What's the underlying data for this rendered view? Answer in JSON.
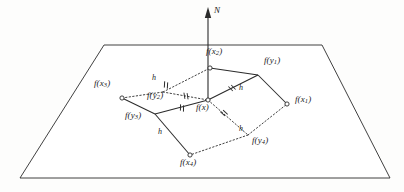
{
  "figure": {
    "type": "geometric-diagram",
    "background_color": "#fdfdfc",
    "line_color": "#2b2b2b",
    "axis": {
      "label": "N",
      "name": "normal-vector"
    },
    "plane": {
      "name": "tangent-plane",
      "shape": "trapezoid",
      "points": "104,45 322,45 390,178 20,178"
    },
    "center": {
      "label": "f(x)",
      "base": "f",
      "arg": "x",
      "sub": "",
      "x": 208,
      "y": 100
    },
    "nodes": [
      {
        "id": "fx1",
        "base": "f",
        "arg": "x",
        "sub": "1",
        "label": "f(x1)",
        "x": 287,
        "y": 104,
        "marker": "circle",
        "label_dx": 8,
        "label_dy": -4
      },
      {
        "id": "fx2",
        "base": "f",
        "arg": "x",
        "sub": "2",
        "label": "f(x2)",
        "x": 210,
        "y": 68,
        "marker": "circle",
        "label_dx": -4,
        "label_dy": -16
      },
      {
        "id": "fx3",
        "base": "f",
        "arg": "x",
        "sub": "3",
        "label": "f(x3)",
        "x": 122,
        "y": 98,
        "marker": "circle",
        "label_dx": -28,
        "label_dy": -14
      },
      {
        "id": "fx4",
        "base": "f",
        "arg": "x",
        "sub": "4",
        "label": "f(x4)",
        "x": 190,
        "y": 155,
        "marker": "circle",
        "label_dx": -10,
        "label_dy": 8
      },
      {
        "id": "fy1",
        "base": "f",
        "arg": "y",
        "sub": "1",
        "label": "f(y1)",
        "x": 258,
        "y": 75,
        "marker": "vertex",
        "label_dx": 6,
        "label_dy": -14
      },
      {
        "id": "fy2",
        "base": "f",
        "arg": "y",
        "sub": "2",
        "label": "f(y2)",
        "x": 163,
        "y": 92,
        "marker": "vertex",
        "label_dx": -16,
        "label_dy": 4
      },
      {
        "id": "fy3",
        "base": "f",
        "arg": "y",
        "sub": "3",
        "label": "f(y3)",
        "x": 155,
        "y": 114,
        "marker": "vertex",
        "label_dx": -30,
        "label_dy": 2
      },
      {
        "id": "fy4",
        "base": "f",
        "arg": "y",
        "sub": "4",
        "label": "f(y4)",
        "x": 248,
        "y": 135,
        "marker": "vertex",
        "label_dx": 4,
        "label_dy": 6
      }
    ],
    "solid_edges": [
      {
        "name": "edge-fx2-fy1",
        "from": "fx2",
        "to": "fy1"
      },
      {
        "name": "edge-fy1-fx1",
        "from": "fy1",
        "to": "fx1"
      },
      {
        "name": "edge-fy1-fx",
        "from": "fy1",
        "to": "center"
      },
      {
        "name": "edge-fx-fy3",
        "from": "center",
        "to": "fy3"
      },
      {
        "name": "edge-fy3-fx3",
        "from": "fy3",
        "to": "fx3"
      },
      {
        "name": "edge-fy3-fx4",
        "from": "fy3",
        "to": "fx4"
      }
    ],
    "dotted_edges": [
      {
        "name": "dotted-fx3-fy2",
        "from": "fx3",
        "to": "fy2"
      },
      {
        "name": "dotted-fy2-fx2",
        "from": "fy2",
        "to": "fx2"
      },
      {
        "name": "dotted-fy2-fx",
        "from": "fy2",
        "to": "center"
      },
      {
        "name": "dotted-fx-fy4",
        "from": "center",
        "to": "fy4"
      },
      {
        "name": "dotted-fy4-fx1",
        "from": "fy4",
        "to": "fx1"
      },
      {
        "name": "dotted-fy4-fx4",
        "from": "fy4",
        "to": "fx4"
      }
    ],
    "h_labels": [
      {
        "name": "h-label-upper-left",
        "text": "h",
        "x": 152,
        "y": 74
      },
      {
        "name": "h-label-upper-right",
        "text": "h",
        "x": 239,
        "y": 84
      },
      {
        "name": "h-label-lower-left",
        "text": "h",
        "x": 158,
        "y": 128
      },
      {
        "name": "h-label-lower-right",
        "text": "h",
        "x": 239,
        "y": 125
      }
    ],
    "tick_marks": [
      {
        "name": "tick-fx2-fy1",
        "x": 166,
        "y": 85,
        "angle": 20
      },
      {
        "name": "tick-fy1-fx",
        "x": 232,
        "y": 88,
        "angle": -28
      },
      {
        "name": "tick-fx-fy3",
        "x": 182,
        "y": 108,
        "angle": 18
      },
      {
        "name": "tick-fy2-fx",
        "x": 186,
        "y": 96,
        "angle": 8
      },
      {
        "name": "tick-fx-fy4",
        "x": 224,
        "y": 113,
        "angle": -30
      }
    ]
  }
}
